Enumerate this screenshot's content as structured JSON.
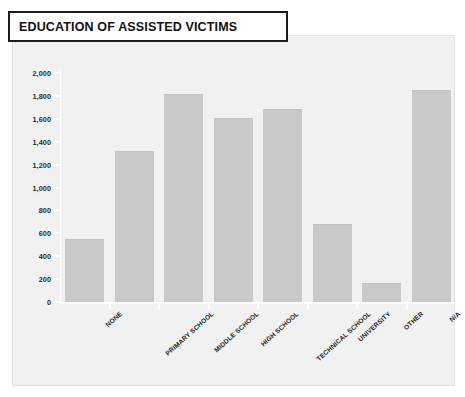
{
  "title": "EDUCATION OF ASSISTED VICTIMS",
  "colors": {
    "bar": "#c9c9c9",
    "panel_background": "#f1f1f1",
    "page_background": "#ffffff",
    "title_border": "#1c1c1c",
    "text": "#1f1f1f",
    "gridline": "#ffffff"
  },
  "chart_data": {
    "type": "bar",
    "title": "EDUCATION OF ASSISTED VICTIMS",
    "xlabel": "",
    "ylabel": "",
    "categories": [
      "NONE",
      "PRIMARY SCHOOL",
      "MIDDLE SCHOOL",
      "HIGH SCHOOL",
      "TECHNICAL SCHOOL",
      "UNIVERSITY",
      "OTHER",
      "N/A"
    ],
    "values": [
      550,
      1320,
      1820,
      1610,
      1690,
      680,
      170,
      1850
    ],
    "ylim": [
      0,
      2000
    ],
    "ytick_step": 200,
    "ytick_labels": [
      "0",
      "200",
      "400",
      "600",
      "800",
      "1,000",
      "1,200",
      "1,400",
      "1,600",
      "1,800",
      "2,000"
    ],
    "ytick_values": [
      0,
      200,
      400,
      600,
      800,
      1000,
      1200,
      1400,
      1600,
      1800,
      2000
    ],
    "grid": false,
    "legend": null,
    "series_name": "Assisted victims"
  }
}
